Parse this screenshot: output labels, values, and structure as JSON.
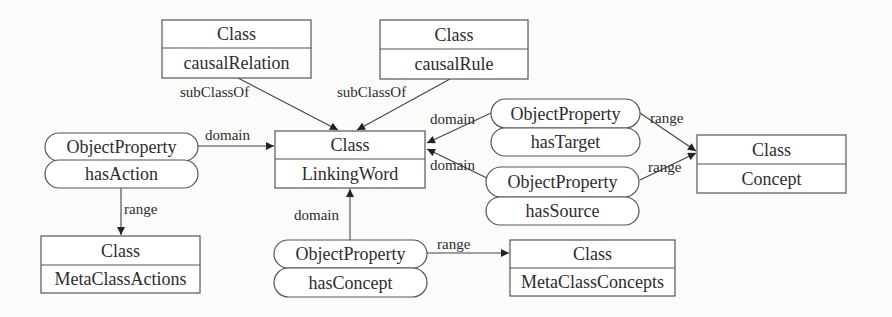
{
  "diagram": {
    "classes": {
      "causalRelation": {
        "stereotype": "Class",
        "name": "causalRelation"
      },
      "causalRule": {
        "stereotype": "Class",
        "name": "causalRule"
      },
      "linkingWord": {
        "stereotype": "Class",
        "name": "LinkingWord"
      },
      "concept": {
        "stereotype": "Class",
        "name": "Concept"
      },
      "metaClassActions": {
        "stereotype": "Class",
        "name": "MetaClassActions"
      },
      "metaClassConcepts": {
        "stereotype": "Class",
        "name": "MetaClassConcepts"
      }
    },
    "properties": {
      "hasAction": {
        "stereotype": "ObjectProperty",
        "name": "hasAction"
      },
      "hasTarget": {
        "stereotype": "ObjectProperty",
        "name": "hasTarget"
      },
      "hasSource": {
        "stereotype": "ObjectProperty",
        "name": "hasSource"
      },
      "hasConcept": {
        "stereotype": "ObjectProperty",
        "name": "hasConcept"
      }
    },
    "edges": {
      "causalRelation_subClassOf": "subClassOf",
      "causalRule_subClassOf": "subClassOf",
      "hasAction_domain": "domain",
      "hasAction_range": "range",
      "hasTarget_domain": "domain",
      "hasTarget_range": "range",
      "hasSource_domain": "domain",
      "hasSource_range": "range",
      "hasConcept_domain": "domain",
      "hasConcept_range": "range"
    }
  }
}
